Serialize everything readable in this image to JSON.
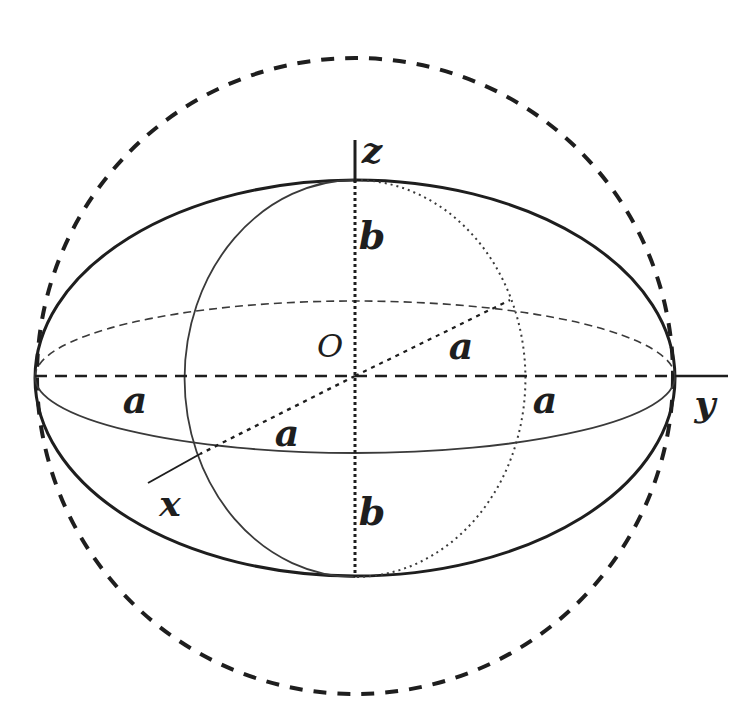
{
  "figure": {
    "type": "ellipsoid-of-revolution",
    "colors": {
      "background": "#ffffff",
      "ink": "#1e1e1e",
      "thin_line": "#3a3a3a"
    },
    "geometry": {
      "center": [
        355,
        376
      ],
      "outer_ellipse": {
        "rx": 320,
        "ry": 198
      },
      "dashed_circle": {
        "r": 318
      },
      "equator_ellipse": {
        "rx": 320,
        "ry": 76
      },
      "meridian_ellipse": {
        "rx": 170,
        "ry": 198
      },
      "x_axis_end": [
        148,
        483
      ],
      "y_axis_end": [
        728,
        376
      ],
      "z_axis_top": [
        355,
        140
      ]
    },
    "labels": {
      "axis_z": "z",
      "axis_y": "y",
      "axis_x": "x",
      "origin": "O",
      "b_upper": "b",
      "b_lower": "b",
      "a_left": "a",
      "a_right": "a",
      "a_diag_upper": "a",
      "a_diag_lower": "a"
    }
  }
}
